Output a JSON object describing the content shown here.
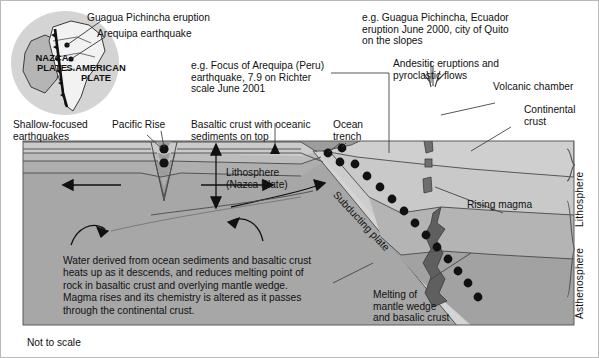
{
  "figure": {
    "title_hidden": "Subduction zone cross-section: Nazca Plate beneath South American Plate",
    "footer_note": "Not to scale"
  },
  "inset_map": {
    "name": "south-america-plate-map",
    "callouts": [
      {
        "id": "eruption",
        "text": "Guagua Pichincha eruption"
      },
      {
        "id": "earthquake",
        "text": "Arequipa earthquake"
      }
    ],
    "plate_labels": [
      {
        "id": "nazca",
        "line1": "NAZCA",
        "line2": "PLATE"
      },
      {
        "id": "s-american",
        "line1": "S.AMERICAN",
        "line2": "PLATE"
      }
    ]
  },
  "annotations": {
    "arequipa_note": "e.g. Focus of Arequipa (Peru)\nearthquake, 7.9 on Richter\nscale June 2001",
    "quito_note": "e.g. Guagua Pichincha, Ecuador\neruption June 2000, city of Quito\non the slopes",
    "andesitic": "Andesitic eruptions and\npyroclastic flows",
    "volcanic_chamber": "Volcanic chamber",
    "continental_crust": "Continental\ncrust",
    "shallow_earthquakes": "Shallow-focused\nearthquakes",
    "pacific_rise": "Pacific Rise",
    "basaltic_crust": "Basaltic crust with oceanic\nsediments on top",
    "ocean_trench": "Ocean\ntrench",
    "lithosphere_nazca": "Lithosphere\n(Nazca Plate)",
    "subducting_plate": "Subducting plate",
    "rising_magma": "Rising magma",
    "melting_wedge": "Melting of\nmantle wedge\nand basalic crust",
    "body_text": "Water derived from ocean sediments and basaltic crust heats up as it descends, and reduces melting point of rock in basaltic crust and overlying mantle wedge. Magma rises and its chemistry is altered as it passes through the continental crust.",
    "lithosphere_right": "Lithosphere",
    "asthenosphere_right": "Asthenosphere"
  },
  "colors": {
    "background": "#ffffff",
    "asthenosphere": "#9d9d9d",
    "lithosphere_mantle": "#a9a9a9",
    "crust_band": "#b4b4b4",
    "sediment_band": "#c3c3c3",
    "continental": "#c9c9c9",
    "slab_light": "#d2d2d2",
    "magma": "#6d6d6d",
    "outline": "#3a3a3a",
    "text": "#111111"
  }
}
